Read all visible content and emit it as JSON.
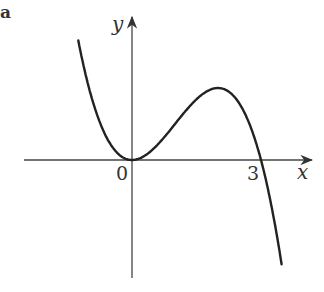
{
  "figure": {
    "part_label": "a",
    "axis_x_label": "x",
    "axis_y_label": "y",
    "origin_label": "0",
    "root_label": "3"
  },
  "curve": {
    "description": "cubic y = k x^2 (3 - x), touching origin, peak near x=2, crossing x-axis at 3",
    "color": "#222222"
  }
}
